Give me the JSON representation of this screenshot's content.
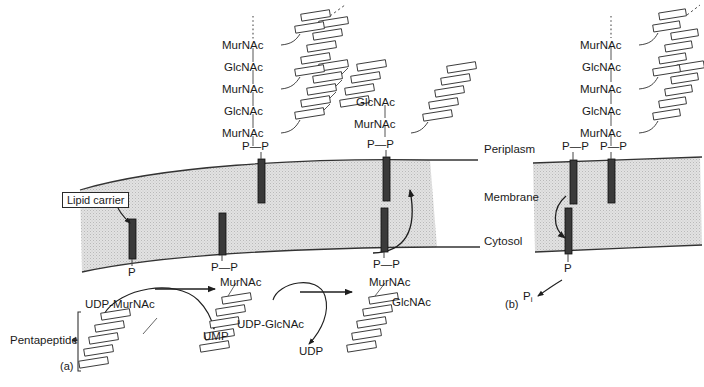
{
  "figure": {
    "type": "biochemical-pathway-diagram",
    "panels": [
      {
        "id": "a",
        "label": "(a)",
        "x": 60,
        "y": 360
      },
      {
        "id": "b",
        "label": "(b)",
        "x": 505,
        "y": 298
      }
    ]
  },
  "membrane": {
    "labels": {
      "periplasm": "Periplasm",
      "membrane": "Membrane",
      "cytosol": "Cytosol"
    },
    "fill_color": "#dcdcdc",
    "line_color": "#333333"
  },
  "panel_a": {
    "lipid_carrier_callout": "Lipid carrier",
    "chain_left": {
      "residues": [
        "MurNAc",
        "GlcNAc",
        "MurNAc",
        "GlcNAc",
        "MurNAc"
      ],
      "anchor": "P—P",
      "continuation": "dotted-line-upward"
    },
    "chain_right": {
      "residues": [
        "GlcNAc",
        "MurNAc"
      ],
      "anchor": "P—P"
    },
    "cytosol_anchors": {
      "left_lipid": "P",
      "middle_lipid": "P—P",
      "right_lipid": "P—P"
    },
    "reactions": [
      {
        "substrate": "UDP-MurNAc",
        "product": "UMP",
        "result_residues": [
          "MurNAc"
        ],
        "result_anchor": "P—P"
      },
      {
        "substrate": "UDP-GlcNAc",
        "product": "UDP",
        "result_residues": [
          "MurNAc",
          "GlcNAc"
        ],
        "result_anchor": "P—P"
      }
    ],
    "pentapeptide_label": "Pentapeptide",
    "pentapeptide_unit_count": 5
  },
  "panel_b": {
    "chain": {
      "residues": [
        "MurNAc",
        "GlcNAc",
        "MurNAc",
        "GlcNAc",
        "MurNAc"
      ],
      "anchor": "P—P",
      "continuation": "dotted-line-upward"
    },
    "free_carrier_anchor": "P—P",
    "recycled_anchor": "P",
    "released_phosphate": "P",
    "released_phosphate_subscript": "i"
  },
  "colors": {
    "lipid_bar": "#3a3a3a",
    "membrane_fill": "#dcdcdc",
    "stroke": "#2b2b2b",
    "peptide_fill": "#ffffff"
  }
}
